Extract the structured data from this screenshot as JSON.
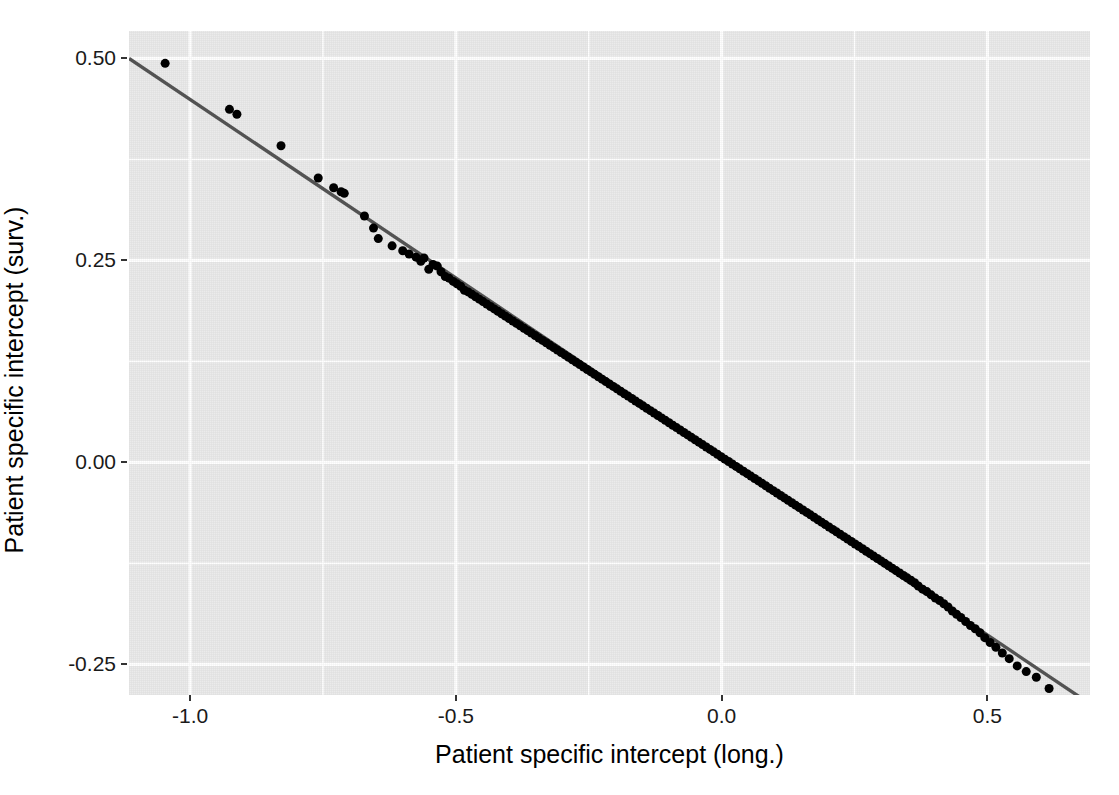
{
  "chart_data": {
    "type": "scatter",
    "title": "",
    "xlabel": "Patient specific intercept (long.)",
    "ylabel": "Patient specific intercept (surv.)",
    "xlim": [
      -1.115,
      0.693
    ],
    "ylim": [
      -0.288,
      0.534
    ],
    "xticks": [
      -1.0,
      -0.5,
      0.0,
      0.5
    ],
    "xticklabels": [
      "-1.0",
      "-0.5",
      "0.0",
      "0.5"
    ],
    "yticks": [
      0.5,
      0.25,
      0.0,
      -0.25
    ],
    "yticklabels": [
      "0.50",
      "0.25",
      "0.00",
      "-0.25"
    ],
    "x_minor_ticks": [
      -0.75,
      -0.25,
      0.25,
      0.5
    ],
    "y_minor_ticks": [
      0.375,
      0.125,
      -0.125
    ],
    "grid": true,
    "legend": null,
    "panel_background": "#ebebeb",
    "grid_color": "#ffffff",
    "point_color": "#000000",
    "line_color": "#555555",
    "point_size": 9,
    "fit_line": {
      "type": "linear",
      "slope": -0.4425,
      "intercept": 0.0065,
      "x_start": -1.115,
      "x_end": 0.693,
      "y_start": 0.5,
      "y_end": -0.299
    },
    "series": [
      {
        "name": "patients",
        "points": [
          [
            -1.047,
            0.494
          ],
          [
            -0.926,
            0.437
          ],
          [
            -0.912,
            0.431
          ],
          [
            -0.829,
            0.392
          ],
          [
            -0.759,
            0.352
          ],
          [
            -0.73,
            0.34
          ],
          [
            -0.716,
            0.335
          ],
          [
            -0.71,
            0.333
          ],
          [
            -0.672,
            0.305
          ],
          [
            -0.655,
            0.29
          ],
          [
            -0.646,
            0.277
          ],
          [
            -0.62,
            0.268
          ],
          [
            -0.6,
            0.262
          ],
          [
            -0.588,
            0.258
          ],
          [
            -0.575,
            0.254
          ],
          [
            -0.566,
            0.249
          ],
          [
            -0.56,
            0.253
          ],
          [
            -0.551,
            0.239
          ],
          [
            -0.543,
            0.245
          ],
          [
            -0.535,
            0.243
          ],
          [
            -0.528,
            0.236
          ],
          [
            -0.52,
            0.23
          ],
          [
            -0.513,
            0.228
          ],
          [
            -0.505,
            0.224
          ],
          [
            -0.498,
            0.221
          ],
          [
            -0.491,
            0.218
          ],
          [
            -0.484,
            0.213
          ],
          [
            -0.477,
            0.211
          ],
          [
            -0.47,
            0.208
          ],
          [
            -0.463,
            0.205
          ],
          [
            -0.456,
            0.202
          ],
          [
            -0.449,
            0.199
          ],
          [
            -0.442,
            0.196
          ],
          [
            -0.435,
            0.193
          ],
          [
            -0.428,
            0.19
          ],
          [
            -0.421,
            0.187
          ],
          [
            -0.414,
            0.184
          ],
          [
            -0.407,
            0.181
          ],
          [
            -0.4,
            0.178
          ],
          [
            -0.393,
            0.175
          ],
          [
            -0.386,
            0.172
          ],
          [
            -0.379,
            0.169
          ],
          [
            -0.372,
            0.166
          ],
          [
            -0.365,
            0.163
          ],
          [
            -0.358,
            0.16
          ],
          [
            -0.351,
            0.157
          ],
          [
            -0.344,
            0.154
          ],
          [
            -0.337,
            0.151
          ],
          [
            -0.33,
            0.148
          ],
          [
            -0.323,
            0.145
          ],
          [
            -0.316,
            0.142
          ],
          [
            -0.309,
            0.139
          ],
          [
            -0.302,
            0.136
          ],
          [
            -0.295,
            0.133
          ],
          [
            -0.288,
            0.13
          ],
          [
            -0.281,
            0.127
          ],
          [
            -0.274,
            0.124
          ],
          [
            -0.267,
            0.121
          ],
          [
            -0.26,
            0.118
          ],
          [
            -0.253,
            0.115
          ],
          [
            -0.246,
            0.112
          ],
          [
            -0.239,
            0.109
          ],
          [
            -0.232,
            0.106
          ],
          [
            -0.225,
            0.103
          ],
          [
            -0.218,
            0.1
          ],
          [
            -0.211,
            0.097
          ],
          [
            -0.204,
            0.094
          ],
          [
            -0.197,
            0.091
          ],
          [
            -0.19,
            0.088
          ],
          [
            -0.183,
            0.085
          ],
          [
            -0.176,
            0.082
          ],
          [
            -0.169,
            0.079
          ],
          [
            -0.162,
            0.076
          ],
          [
            -0.155,
            0.073
          ],
          [
            -0.148,
            0.07
          ],
          [
            -0.141,
            0.067
          ],
          [
            -0.134,
            0.064
          ],
          [
            -0.127,
            0.061
          ],
          [
            -0.12,
            0.058
          ],
          [
            -0.113,
            0.055
          ],
          [
            -0.106,
            0.052
          ],
          [
            -0.099,
            0.049
          ],
          [
            -0.092,
            0.046
          ],
          [
            -0.085,
            0.043
          ],
          [
            -0.078,
            0.04
          ],
          [
            -0.071,
            0.037
          ],
          [
            -0.064,
            0.034
          ],
          [
            -0.057,
            0.031
          ],
          [
            -0.05,
            0.028
          ],
          [
            -0.043,
            0.025
          ],
          [
            -0.036,
            0.022
          ],
          [
            -0.029,
            0.019
          ],
          [
            -0.022,
            0.016
          ],
          [
            -0.015,
            0.013
          ],
          [
            -0.008,
            0.01
          ],
          [
            -0.001,
            0.007
          ],
          [
            0.006,
            0.004
          ],
          [
            0.013,
            0.001
          ],
          [
            0.02,
            -0.002
          ],
          [
            0.027,
            -0.005
          ],
          [
            0.034,
            -0.008
          ],
          [
            0.041,
            -0.011
          ],
          [
            0.048,
            -0.014
          ],
          [
            0.055,
            -0.017
          ],
          [
            0.062,
            -0.02
          ],
          [
            0.069,
            -0.023
          ],
          [
            0.076,
            -0.026
          ],
          [
            0.083,
            -0.029
          ],
          [
            0.09,
            -0.032
          ],
          [
            0.097,
            -0.035
          ],
          [
            0.104,
            -0.038
          ],
          [
            0.111,
            -0.041
          ],
          [
            0.118,
            -0.044
          ],
          [
            0.125,
            -0.047
          ],
          [
            0.132,
            -0.05
          ],
          [
            0.139,
            -0.053
          ],
          [
            0.146,
            -0.056
          ],
          [
            0.153,
            -0.059
          ],
          [
            0.16,
            -0.062
          ],
          [
            0.167,
            -0.065
          ],
          [
            0.174,
            -0.068
          ],
          [
            0.181,
            -0.071
          ],
          [
            0.188,
            -0.074
          ],
          [
            0.195,
            -0.077
          ],
          [
            0.202,
            -0.08
          ],
          [
            0.209,
            -0.083
          ],
          [
            0.216,
            -0.086
          ],
          [
            0.223,
            -0.089
          ],
          [
            0.23,
            -0.092
          ],
          [
            0.237,
            -0.095
          ],
          [
            0.244,
            -0.098
          ],
          [
            0.251,
            -0.101
          ],
          [
            0.258,
            -0.104
          ],
          [
            0.265,
            -0.107
          ],
          [
            0.272,
            -0.11
          ],
          [
            0.279,
            -0.113
          ],
          [
            0.286,
            -0.116
          ],
          [
            0.293,
            -0.119
          ],
          [
            0.3,
            -0.122
          ],
          [
            0.307,
            -0.125
          ],
          [
            0.314,
            -0.128
          ],
          [
            0.321,
            -0.131
          ],
          [
            0.328,
            -0.134
          ],
          [
            0.335,
            -0.137
          ],
          [
            0.342,
            -0.14
          ],
          [
            0.349,
            -0.143
          ],
          [
            0.356,
            -0.146
          ],
          [
            0.363,
            -0.149
          ],
          [
            0.37,
            -0.153
          ],
          [
            0.378,
            -0.157
          ],
          [
            0.386,
            -0.16
          ],
          [
            0.394,
            -0.164
          ],
          [
            0.402,
            -0.168
          ],
          [
            0.41,
            -0.171
          ],
          [
            0.418,
            -0.175
          ],
          [
            0.426,
            -0.179
          ],
          [
            0.434,
            -0.184
          ],
          [
            0.442,
            -0.188
          ],
          [
            0.45,
            -0.192
          ],
          [
            0.459,
            -0.197
          ],
          [
            0.468,
            -0.202
          ],
          [
            0.477,
            -0.206
          ],
          [
            0.486,
            -0.211
          ],
          [
            0.495,
            -0.217
          ],
          [
            0.505,
            -0.223
          ],
          [
            0.516,
            -0.229
          ],
          [
            0.528,
            -0.236
          ],
          [
            0.541,
            -0.243
          ],
          [
            0.556,
            -0.252
          ],
          [
            0.573,
            -0.259
          ],
          [
            0.592,
            -0.266
          ],
          [
            0.616,
            -0.28
          ]
        ]
      }
    ]
  }
}
